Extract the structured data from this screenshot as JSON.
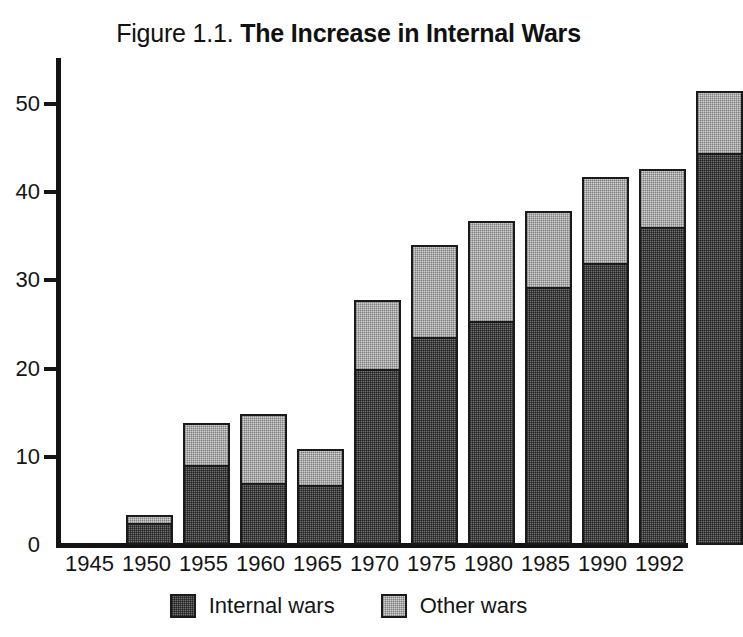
{
  "title": {
    "prefix": "Figure 1.1.",
    "main": "The Increase in Internal Wars"
  },
  "chart_data": {
    "type": "bar",
    "subtype": "stacked-vertical",
    "title": "Figure 1.1. The Increase in Internal Wars",
    "xlabel": "",
    "ylabel": "",
    "ylim": [
      0,
      55
    ],
    "yticks": [
      0,
      10,
      20,
      30,
      40,
      50
    ],
    "ytick_labels": [
      "0",
      "10",
      "20",
      "30",
      "40",
      "50"
    ],
    "grid": false,
    "legend_position": "bottom-center",
    "categories": [
      "1945",
      "1950",
      "1955",
      "1960",
      "1965",
      "1970",
      "1975",
      "1980",
      "1985",
      "1990",
      "1992"
    ],
    "series": [
      {
        "name": "Internal wars",
        "color": "#6e6e6e",
        "values": [
          2.5,
          9.1,
          7.0,
          6.8,
          20.0,
          23.6,
          25.4,
          29.3,
          32.0,
          36.1,
          44.5
        ]
      },
      {
        "name": "Other wars",
        "color": "#cfcfcf",
        "values": [
          1.1,
          5.0,
          8.1,
          4.3,
          8.0,
          10.7,
          11.6,
          8.8,
          10.0,
          6.8,
          7.2
        ]
      }
    ],
    "totals": [
      3.6,
      14.1,
      15.1,
      11.1,
      28.0,
      34.3,
      37.0,
      38.1,
      42.0,
      42.9,
      51.7
    ]
  },
  "legend": [
    {
      "label": "Internal wars",
      "swatch": "dark"
    },
    {
      "label": "Other wars",
      "swatch": "light"
    }
  ],
  "colors": {
    "axis": "#141414",
    "bar_border": "#1a1a1a",
    "internal_wars": "#6e6e6e",
    "other_wars": "#cfcfcf",
    "background": "#ffffff"
  }
}
